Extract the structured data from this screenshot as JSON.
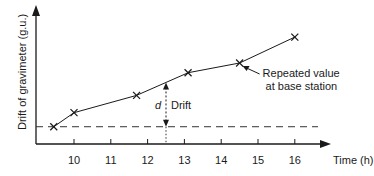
{
  "chart_data": {
    "type": "line",
    "title": "",
    "xlabel": "Time (h)",
    "ylabel": "Drift of gravimeter (g.u.)",
    "xlim": [
      8.5,
      16.8
    ],
    "ylim": [
      0,
      10
    ],
    "x_ticks": [
      10,
      11,
      12,
      13,
      14,
      15,
      16
    ],
    "x_tick_labels": [
      "10",
      "11",
      "12",
      "13",
      "14",
      "15",
      "16"
    ],
    "grid": false,
    "series": [
      {
        "name": "Gravimeter drift",
        "marker": "x",
        "points": [
          {
            "x": 9.45,
            "y": 1.6
          },
          {
            "x": 10.0,
            "y": 2.9
          },
          {
            "x": 11.7,
            "y": 4.5
          },
          {
            "x": 13.1,
            "y": 6.6
          },
          {
            "x": 14.5,
            "y": 7.5
          },
          {
            "x": 16.0,
            "y": 9.9
          }
        ]
      }
    ],
    "baseline": {
      "y": 1.6,
      "style": "dashed"
    },
    "annotations": {
      "drift_marker": {
        "x": 12.5,
        "label_symbol": "d",
        "label_text": "Drift"
      },
      "callout": {
        "text_line1": "Repeated value",
        "text_line2": "at base station",
        "target_point_index": 4
      }
    }
  }
}
